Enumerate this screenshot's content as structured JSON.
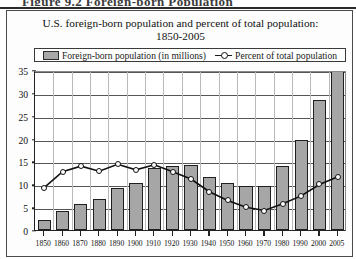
{
  "figure": {
    "caption": "Figure 9.2   Foreign-born Population"
  },
  "chart_data": {
    "type": "bar",
    "title": "U.S. foreign-born population and percent of total population:",
    "subtitle": "1850-2005",
    "xlabel": "",
    "ylabel": "",
    "ylim": [
      0,
      35
    ],
    "grid": true,
    "legend_position": "top",
    "categories": [
      "1850",
      "1860",
      "1870",
      "1880",
      "1890",
      "1900",
      "1910",
      "1920",
      "1930",
      "1940",
      "1950",
      "1960",
      "1970",
      "1980",
      "1990",
      "2000",
      "2005"
    ],
    "yticks": [
      0,
      5,
      10,
      15,
      20,
      25,
      30,
      35
    ],
    "series": [
      {
        "name": "Foreign-born population (in millions)",
        "kind": "bar",
        "color": "#a6a6a6",
        "values": [
          2.2,
          4.1,
          5.6,
          6.7,
          9.2,
          10.3,
          13.5,
          13.9,
          14.2,
          11.6,
          10.3,
          9.7,
          9.6,
          14.1,
          19.8,
          28.4,
          35.7
        ]
      },
      {
        "name": "Percent of total population",
        "kind": "line",
        "color": "#111111",
        "values": [
          9.7,
          13.2,
          14.4,
          13.3,
          14.8,
          13.6,
          14.7,
          13.2,
          11.6,
          8.8,
          6.9,
          5.4,
          4.7,
          6.2,
          7.9,
          10.4,
          12.1
        ]
      }
    ]
  },
  "legend": {
    "items": [
      {
        "label": "Foreign-born population (in millions)",
        "marker": "bar-swatch"
      },
      {
        "label": "Percent of total population",
        "marker": "line-circle"
      }
    ]
  }
}
